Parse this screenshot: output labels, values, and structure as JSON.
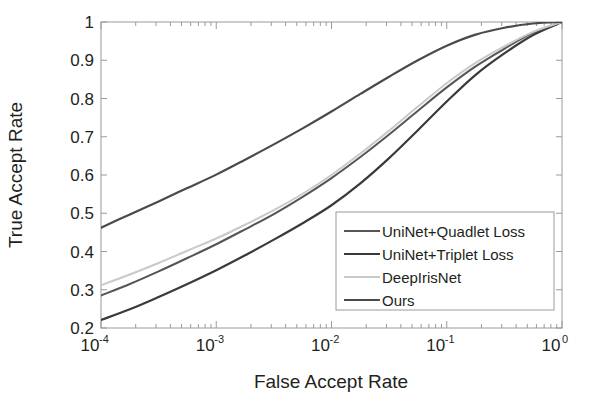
{
  "chart_data": {
    "type": "line",
    "title": "",
    "xlabel": "False Accept Rate",
    "ylabel": "True Accept Rate",
    "xscale": "log",
    "yscale": "linear",
    "xlim": [
      0.0001,
      1
    ],
    "ylim": [
      0.2,
      1
    ],
    "grid": false,
    "legend_position": "lower-right",
    "xticks": [
      0.0001,
      0.001,
      0.01,
      0.1,
      1
    ],
    "xtick_labels": [
      "10-4",
      "10-3",
      "10-2",
      "10-1",
      "100"
    ],
    "xtick_mantissa": [
      "10",
      "10",
      "10",
      "10",
      "10"
    ],
    "xtick_exponents": [
      "-4",
      "-3",
      "-2",
      "-1",
      "0"
    ],
    "yticks": [
      0.2,
      0.3,
      0.4,
      0.5,
      0.6,
      0.7,
      0.8,
      0.9,
      1
    ],
    "ytick_labels": [
      "0.2",
      "0.3",
      "0.4",
      "0.5",
      "0.6",
      "0.7",
      "0.8",
      "0.9",
      "1"
    ],
    "series": [
      {
        "name": "UniNet+Quadlet Loss",
        "color": "#555555",
        "width": 2.0,
        "x": [
          0.0001,
          0.000178,
          0.000316,
          0.000562,
          0.001,
          0.00178,
          0.00316,
          0.00562,
          0.01,
          0.0178,
          0.0316,
          0.0562,
          0.1,
          0.178,
          0.316,
          0.562,
          1
        ],
        "values": [
          0.285,
          0.315,
          0.348,
          0.383,
          0.419,
          0.458,
          0.498,
          0.543,
          0.592,
          0.647,
          0.706,
          0.768,
          0.829,
          0.884,
          0.93,
          0.972,
          1.0
        ]
      },
      {
        "name": "UniNet+Triplet Loss",
        "color": "#3a3a3a",
        "width": 2.2,
        "x": [
          0.0001,
          0.000178,
          0.000316,
          0.000562,
          0.001,
          0.00178,
          0.00316,
          0.00562,
          0.01,
          0.0178,
          0.0316,
          0.0562,
          0.1,
          0.178,
          0.316,
          0.562,
          1
        ],
        "values": [
          0.221,
          0.249,
          0.281,
          0.315,
          0.351,
          0.39,
          0.431,
          0.474,
          0.521,
          0.578,
          0.644,
          0.717,
          0.792,
          0.862,
          0.918,
          0.966,
          1.0
        ]
      },
      {
        "name": "DeepIrisNet",
        "color": "#c9c9c9",
        "width": 2.0,
        "x": [
          0.0001,
          0.000178,
          0.000316,
          0.000562,
          0.001,
          0.00178,
          0.00316,
          0.00562,
          0.01,
          0.0178,
          0.0316,
          0.0562,
          0.1,
          0.178,
          0.316,
          0.562,
          1
        ],
        "values": [
          0.312,
          0.34,
          0.37,
          0.402,
          0.434,
          0.47,
          0.508,
          0.551,
          0.6,
          0.656,
          0.716,
          0.779,
          0.84,
          0.893,
          0.936,
          0.974,
          1.0
        ]
      },
      {
        "name": "Ours",
        "color": "#4a4a4a",
        "width": 2.2,
        "x": [
          0.0001,
          0.000178,
          0.000316,
          0.000562,
          0.001,
          0.00178,
          0.00316,
          0.00562,
          0.01,
          0.0178,
          0.0316,
          0.0562,
          0.1,
          0.178,
          0.316,
          0.562,
          1
        ],
        "values": [
          0.462,
          0.497,
          0.531,
          0.566,
          0.601,
          0.64,
          0.68,
          0.722,
          0.766,
          0.812,
          0.857,
          0.9,
          0.938,
          0.967,
          0.985,
          0.996,
          1.0
        ]
      }
    ]
  },
  "legend": {
    "entries": [
      {
        "label": "UniNet+Quadlet Loss",
        "color": "#555555"
      },
      {
        "label": "UniNet+Triplet Loss",
        "color": "#3a3a3a"
      },
      {
        "label": "DeepIrisNet",
        "color": "#c9c9c9"
      },
      {
        "label": "Ours",
        "color": "#4a4a4a"
      }
    ]
  },
  "axes": {
    "x_title": "False Accept Rate",
    "y_title": "True Accept Rate"
  }
}
